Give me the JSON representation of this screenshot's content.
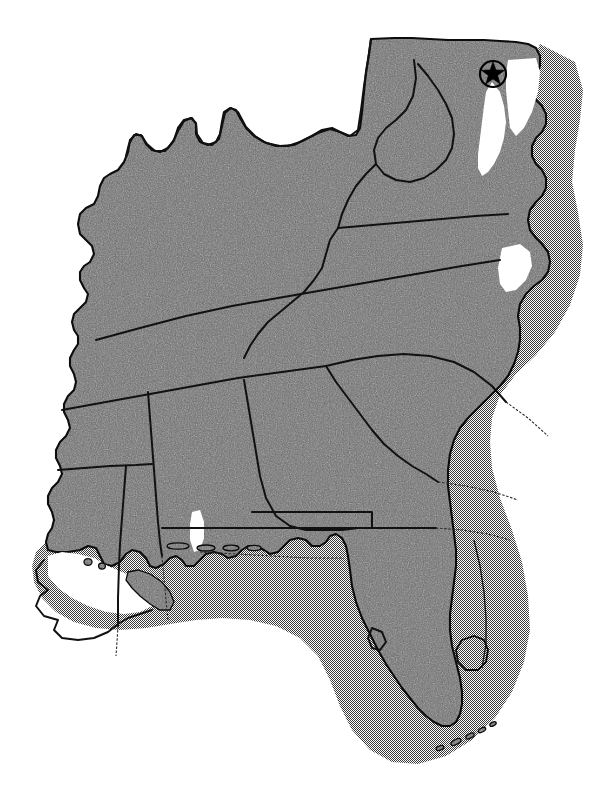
{
  "map": {
    "title": "Southeastern United States Reference Map",
    "kind": "political-outline-halftone",
    "projection_hint": "regional lambert-like",
    "background_color": "#ffffff",
    "land_fill_color": "#6a6a6a",
    "shelf_fill_color": "#b2b2b2",
    "border_color": "#111111",
    "coastline_color": "#0c0c0c",
    "marker_color": "#000000",
    "has_text_labels": false,
    "has_legend": false,
    "has_scale_bar": false,
    "has_north_arrow": false,
    "canvas": {
      "width": 615,
      "height": 797
    }
  },
  "layers": [
    {
      "id": "background",
      "name": "page-background",
      "style": "solid white"
    },
    {
      "id": "shelf",
      "name": "offshore-shelf-halo",
      "style": "50% checkerboard dither"
    },
    {
      "id": "land",
      "name": "land-area-fill",
      "style": "dark gray noise texture"
    },
    {
      "id": "state-borders",
      "name": "state-boundary-lines",
      "style": "thin solid black"
    },
    {
      "id": "coastline",
      "name": "coastline-outline",
      "style": "solid black"
    },
    {
      "id": "hydrography",
      "name": "lakes-and-bays",
      "style": "dither fill, black outline"
    },
    {
      "id": "markers",
      "name": "point-markers",
      "style": "black star in circle"
    }
  ],
  "regions": [
    {
      "name": "west-virginia",
      "label": ""
    },
    {
      "name": "kentucky",
      "label": ""
    },
    {
      "name": "virginia",
      "label": ""
    },
    {
      "name": "tennessee",
      "label": ""
    },
    {
      "name": "north-carolina",
      "label": ""
    },
    {
      "name": "south-carolina",
      "label": ""
    },
    {
      "name": "georgia",
      "label": ""
    },
    {
      "name": "alabama",
      "label": ""
    },
    {
      "name": "mississippi",
      "label": ""
    },
    {
      "name": "louisiana",
      "label": ""
    },
    {
      "name": "florida",
      "label": ""
    },
    {
      "name": "delmarva-peninsula",
      "label": ""
    }
  ],
  "water_features": [
    {
      "name": "chesapeake-bay",
      "label": ""
    },
    {
      "name": "albemarle-pamlico-sound",
      "label": ""
    },
    {
      "name": "lake-okeechobee",
      "label": ""
    },
    {
      "name": "atlantic-ocean",
      "label": ""
    },
    {
      "name": "gulf-of-mexico",
      "label": ""
    }
  ],
  "markers": [
    {
      "name": "capital-star-marker",
      "symbol": "star-in-circle",
      "x": 493,
      "y": 74,
      "radius": 13,
      "color": "#000000",
      "label": ""
    }
  ]
}
